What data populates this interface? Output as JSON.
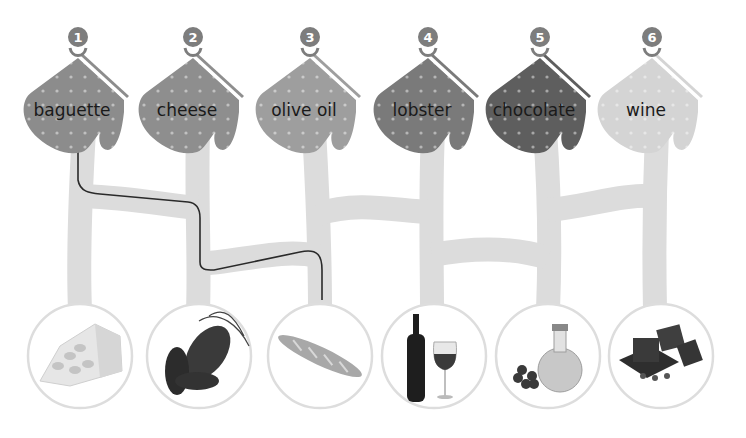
{
  "puzzle": {
    "type": "maze-matching",
    "mitts": [
      {
        "number": "1",
        "label": "baguette",
        "color": "#8c8c8c"
      },
      {
        "number": "2",
        "label": "cheese",
        "color": "#8e8e8e"
      },
      {
        "number": "3",
        "label": "olive oil",
        "color": "#9e9e9e"
      },
      {
        "number": "4",
        "label": "lobster",
        "color": "#7a7a7a"
      },
      {
        "number": "5",
        "label": "chocolate",
        "color": "#5e5e5e"
      },
      {
        "number": "6",
        "label": "wine",
        "color": "#d4d4d4"
      }
    ],
    "pictures": [
      {
        "item": "cheese",
        "icon": "cheese-icon"
      },
      {
        "item": "lobster",
        "icon": "lobster-icon"
      },
      {
        "item": "baguette",
        "icon": "baguette-icon"
      },
      {
        "item": "wine",
        "icon": "wine-icon"
      },
      {
        "item": "olive oil",
        "icon": "olive-oil-icon"
      },
      {
        "item": "chocolate",
        "icon": "chocolate-icon"
      }
    ],
    "solved_example": {
      "from_mitt": "1",
      "to_picture": "baguette"
    },
    "colors": {
      "path": "#dcdcdc",
      "line": "#2a2a2a",
      "badge": "#7d7d7d",
      "circle_stroke": "#dddddd"
    }
  }
}
